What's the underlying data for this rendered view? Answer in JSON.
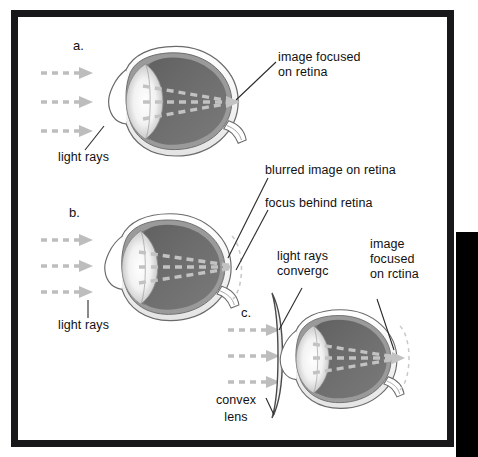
{
  "figure": {
    "kind": "anatomical-diagram",
    "border_color": "#18181a",
    "background": "#ffffff",
    "edge_slab_color": "#000000"
  },
  "palette": {
    "sclera_outline": "#6b6b6b",
    "sclera_fill": "#ffffff",
    "choroid": "#8e8e8e",
    "vitreous_dark": "#6e6e6e",
    "vitreous_darker": "#5a5a5a",
    "lens_white": "#ffffff",
    "aqueous_gray": "#9a9a9a",
    "ray_gray": "#b3b3b3",
    "leader_line": "#2a2a2a",
    "text": "#111111"
  },
  "panels": [
    {
      "id": "a",
      "marker": "a.",
      "condition": "normal emmetropic eye",
      "labels": [
        {
          "name": "light-rays",
          "text": "light rays",
          "lines": [
            "light rays"
          ]
        },
        {
          "name": "image-focused-on-retina",
          "text": "image focused on retina",
          "lines": [
            "image focused",
            "on retina"
          ]
        }
      ]
    },
    {
      "id": "b",
      "marker": "b.",
      "condition": "hyperopic eye, focus falls behind the retina",
      "labels": [
        {
          "name": "light-rays",
          "text": "light rays",
          "lines": [
            "light rays"
          ]
        },
        {
          "name": "blurred-image-on-retina",
          "text": "blurred image on retina",
          "lines": [
            "blurred image on retina"
          ]
        },
        {
          "name": "focus-behind-retina",
          "text": "focus behind retina",
          "lines": [
            "focus behind retina"
          ]
        }
      ]
    },
    {
      "id": "c",
      "marker": "c.",
      "condition": "hyperopic eye corrected by a convex lens",
      "labels": [
        {
          "name": "light-rays-converge",
          "text": "light rays converge",
          "lines": [
            "light rays",
            "convergc"
          ]
        },
        {
          "name": "image-focused-on-retina",
          "text": "image focused on retina",
          "lines": [
            "image",
            "focused",
            "on rctina"
          ]
        },
        {
          "name": "convex-lens",
          "text": "convex lens",
          "lines": [
            "convex",
            "lens"
          ]
        }
      ]
    }
  ],
  "markers": {
    "a": "a.",
    "b": "b.",
    "c": "c."
  },
  "text": {
    "light_rays": "light rays",
    "image_focused_l1": "image focused",
    "image_focused_l2": "on retina",
    "blurred_image": "blurred image on retina",
    "focus_behind": "focus behind retina",
    "converge_l1": "light rays",
    "converge_l2": "convergc",
    "focused_c_l1": "image",
    "focused_c_l2": "focused",
    "focused_c_l3": "on rctina",
    "convex_l1": "convex",
    "convex_l2": "lens"
  }
}
